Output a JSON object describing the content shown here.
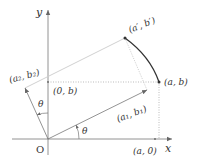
{
  "diagram": {
    "title": "",
    "axes": {
      "x_label": "x",
      "y_label": "y",
      "origin_label": "O"
    },
    "points": {
      "a_b": "(a, b)",
      "a_0": "(a, 0)",
      "zero_b": "(0, b)",
      "a1_b1": "(a₁, b₁)",
      "a2_b2": "(a₂, b₂)",
      "aprime_bprime": "(a′, b′)"
    },
    "angles": {
      "theta_x": "θ",
      "theta_y": "θ"
    },
    "colors": {
      "axis": "#777777",
      "vector": "#666666",
      "light_line": "#cccccc",
      "dotted": "#aaaaaa",
      "arc": "#333333",
      "text": "#333333"
    }
  }
}
